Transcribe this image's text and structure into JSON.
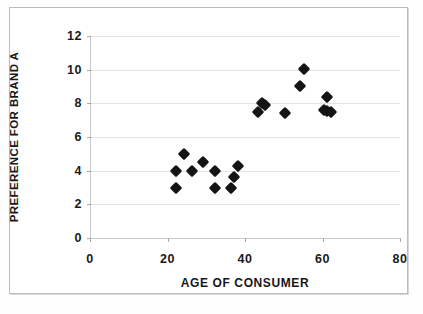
{
  "figure": {
    "background_color": "#ffffff",
    "frame_color": "#b9bcc0",
    "marker_color": "#141414",
    "gridline_color": "#e4e4e4"
  },
  "chart_data": {
    "type": "scatter",
    "title": "",
    "xlabel": "AGE OF CONSUMER",
    "ylabel": "PREFERENCE FOR BRAND A",
    "xlim": [
      0,
      80
    ],
    "ylim": [
      0,
      12
    ],
    "xticks": [
      0,
      20,
      40,
      60,
      80
    ],
    "yticks": [
      0,
      2,
      4,
      6,
      8,
      10,
      12
    ],
    "xtick_labels": [
      "0",
      "20",
      "40",
      "60",
      "80"
    ],
    "ytick_labels": [
      "0",
      "2",
      "4",
      "6",
      "8",
      "10",
      "12"
    ],
    "grid": "horizontal",
    "legend": null,
    "marker": "diamond",
    "series": [
      {
        "name": "Consumers",
        "points": [
          {
            "x": 22,
            "y": 4.0
          },
          {
            "x": 22,
            "y": 3.0
          },
          {
            "x": 24,
            "y": 5.0
          },
          {
            "x": 26,
            "y": 4.0
          },
          {
            "x": 29,
            "y": 4.5
          },
          {
            "x": 32,
            "y": 4.0
          },
          {
            "x": 32,
            "y": 3.0
          },
          {
            "x": 36,
            "y": 3.0
          },
          {
            "x": 37,
            "y": 3.6
          },
          {
            "x": 38,
            "y": 4.25
          },
          {
            "x": 43,
            "y": 7.5
          },
          {
            "x": 44,
            "y": 8.0
          },
          {
            "x": 45,
            "y": 7.9
          },
          {
            "x": 50,
            "y": 7.4
          },
          {
            "x": 54,
            "y": 9.05
          },
          {
            "x": 55,
            "y": 10.05
          },
          {
            "x": 60,
            "y": 7.6
          },
          {
            "x": 61,
            "y": 8.4
          },
          {
            "x": 61,
            "y": 7.55
          },
          {
            "x": 62,
            "y": 7.5
          }
        ]
      }
    ]
  }
}
